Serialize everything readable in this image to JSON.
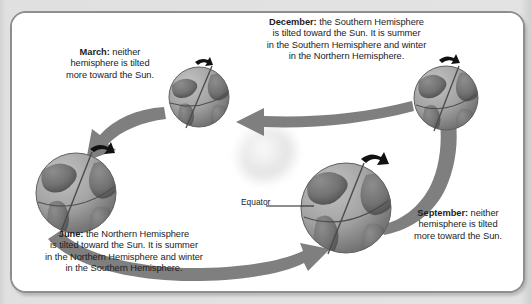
{
  "figure": {
    "type": "seasons-diagram",
    "title_cutoff_fragment": "",
    "background_color": "#dcdcdc",
    "frame_color": "#8e8e8e",
    "frame_fill": "#ffffff",
    "arrow_color": "#7b7b7b",
    "globe_color": "#9a9a9a",
    "sun_color": "#e6e6e6",
    "text_color": "#1c1c1c"
  },
  "sun": {
    "name": "Sun",
    "cx": 256,
    "cy": 143
  },
  "labels": {
    "equator": "Equator"
  },
  "captions": {
    "december": {
      "month": "December:",
      "text": " the Southern Hemisphere\nis tilted toward the Sun. It is summer\nin the Southern Hemisphere and winter\nin the Northern Hemisphere.",
      "full": "December: the Southern Hemisphere is tilted toward the Sun. It is summer in the Southern Hemisphere and winter in the Northern Hemisphere."
    },
    "march": {
      "month": "March:",
      "text": " neither\nhemisphere is tilted\nmore toward the Sun.",
      "full": "March: neither hemisphere is tilted more toward the Sun."
    },
    "june": {
      "month": "June:",
      "text": " the Northern Hemisphere\nis tilted toward the Sun. It is summer\nin the Northern Hemisphere and winter\nin the Southern Hemisphere.",
      "full": "June: the Northern Hemisphere is tilted toward the Sun. It is summer in the Northern Hemisphere and winter in the Southern Hemisphere."
    },
    "september": {
      "month": "September:",
      "text": " neither\nhemisphere is tilted\nmore toward the Sun.",
      "full": "September: neither hemisphere is tilted more toward the Sun."
    }
  },
  "globes": [
    {
      "id": "march",
      "label": "March globe",
      "cx": 187,
      "cy": 84,
      "r": 30,
      "tilt": 23.5
    },
    {
      "id": "december",
      "label": "December globe",
      "cx": 434,
      "cy": 85,
      "r": 32,
      "tilt": 23.5
    },
    {
      "id": "june",
      "label": "June globe",
      "cx": 64,
      "cy": 180,
      "r": 40,
      "tilt": 23.5
    },
    {
      "id": "september",
      "label": "September globe",
      "cx": 334,
      "cy": 195,
      "r": 45,
      "tilt": 23.5
    }
  ],
  "orbit_arrows": [
    {
      "id": "december-to-march",
      "direction": "left"
    },
    {
      "id": "march-to-june",
      "direction": "down-left"
    },
    {
      "id": "june-to-september",
      "direction": "right"
    },
    {
      "id": "september-to-december",
      "direction": "up-right"
    }
  ]
}
